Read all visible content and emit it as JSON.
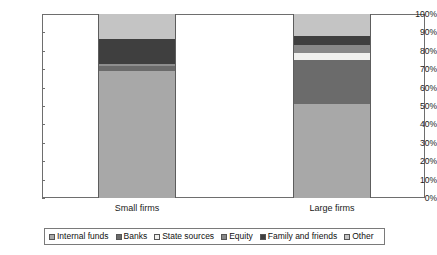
{
  "chart_data": {
    "type": "bar",
    "subtype": "stacked-100-percent",
    "title": "",
    "xlabel": "",
    "ylabel": "",
    "categories": [
      "Small firms",
      "Large firms"
    ],
    "ylim": [
      0,
      100
    ],
    "ytick_labels": [
      "100%",
      "90%",
      "80%",
      "70%",
      "60%",
      "50%",
      "40%",
      "30%",
      "20%",
      "10%",
      "0%"
    ],
    "ytick_values": [
      100,
      90,
      80,
      70,
      60,
      50,
      40,
      30,
      20,
      10,
      0
    ],
    "grid": false,
    "legend_position": "bottom",
    "series": [
      {
        "name": "Internal funds",
        "color": "#a8a8a8",
        "values": [
          69,
          51
        ]
      },
      {
        "name": "Banks",
        "color": "#6b6b6b",
        "values": [
          3,
          24
        ]
      },
      {
        "name": "State sources",
        "color": "#f0f0ee",
        "values": [
          1,
          4
        ]
      },
      {
        "name": "Equity",
        "color": "#888888",
        "values": [
          0,
          4
        ]
      },
      {
        "name": "Family and friends",
        "color": "#3f3f3f",
        "values": [
          13.5,
          5
        ]
      },
      {
        "name": "Other",
        "color": "#c4c4c4",
        "values": [
          13.5,
          12
        ]
      }
    ]
  },
  "axis": {
    "y_labels": [
      "100%",
      "90%",
      "80%",
      "70%",
      "60%",
      "50%",
      "40%",
      "30%",
      "20%",
      "10%",
      "0%"
    ]
  },
  "categories": {
    "small": "Small firms",
    "large": "Large firms"
  },
  "legend": {
    "items": [
      {
        "label": "Internal funds"
      },
      {
        "label": "Banks"
      },
      {
        "label": "State sources"
      },
      {
        "label": "Equity"
      },
      {
        "label": "Family and friends"
      },
      {
        "label": "Other"
      }
    ]
  }
}
